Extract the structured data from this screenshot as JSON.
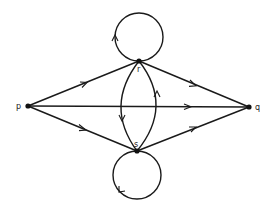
{
  "diagram": {
    "type": "directed-multigraph",
    "colors": {
      "stroke": "#1a1a1a",
      "vertex": "#111111",
      "background": "#ffffff"
    },
    "vertices": [
      {
        "id": "p",
        "label": "p",
        "x": 28,
        "y": 106
      },
      {
        "id": "q",
        "label": "q",
        "x": 249,
        "y": 107
      },
      {
        "id": "r",
        "label": "r",
        "x": 139,
        "y": 61
      },
      {
        "id": "s",
        "label": "s",
        "x": 137,
        "y": 151
      }
    ],
    "edges": [
      {
        "from": "p",
        "to": "r",
        "kind": "straight"
      },
      {
        "from": "r",
        "to": "q",
        "kind": "straight"
      },
      {
        "from": "p",
        "to": "q",
        "kind": "straight"
      },
      {
        "from": "p",
        "to": "s",
        "kind": "straight"
      },
      {
        "from": "s",
        "to": "q",
        "kind": "straight"
      },
      {
        "from": "r",
        "to": "s",
        "kind": "curved-left"
      },
      {
        "from": "s",
        "to": "r",
        "kind": "curved-right"
      },
      {
        "from": "r",
        "to": "r",
        "kind": "loop-top"
      },
      {
        "from": "s",
        "to": "s",
        "kind": "loop-bottom"
      }
    ]
  }
}
